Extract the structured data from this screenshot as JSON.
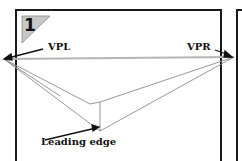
{
  "figure": {
    "step_number": "1",
    "labels": {
      "vpl": "VPL",
      "vpr": "VPR",
      "leading_edge": "Leading edge"
    },
    "colors": {
      "frame": "#1a1a1a",
      "horizon": "#b0b0b0",
      "construction_lines": "#8a8a8a",
      "badge_fill": "#c8c8c8"
    }
  }
}
